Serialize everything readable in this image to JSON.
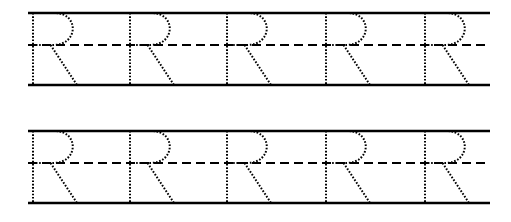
{
  "worksheet": {
    "title": "Letter R Tracing Practice Worksheet",
    "letter": "R",
    "letter_case": "uppercase",
    "background_color": "#ffffff",
    "ink_color": "#000000",
    "guide_line_color": "#000000",
    "trace_dot_color": "#000000",
    "rows": [
      {
        "row_index": 1,
        "name": "practice-row-1",
        "top_rule_y": 13,
        "mid_rule_y": 45,
        "base_rule_y": 85,
        "rule_left_x": 28,
        "rule_right_x": 490,
        "top_rule_style": "solid",
        "mid_rule_style": "dashed",
        "base_rule_style": "solid",
        "letter_count": 5,
        "letter_stem_x": [
          33,
          130,
          227,
          326,
          425
        ],
        "letters": [
          "R",
          "R",
          "R",
          "R",
          "R"
        ]
      },
      {
        "row_index": 2,
        "name": "practice-row-2",
        "top_rule_y": 131,
        "mid_rule_y": 163,
        "base_rule_y": 203,
        "rule_left_x": 28,
        "rule_right_x": 490,
        "top_rule_style": "solid",
        "mid_rule_style": "dashed",
        "base_rule_style": "solid",
        "letter_count": 5,
        "letter_stem_x": [
          33,
          130,
          227,
          326,
          425
        ],
        "letters": [
          "R",
          "R",
          "R",
          "R",
          "R"
        ]
      }
    ],
    "glyph_geometry": {
      "stem_width": 0,
      "letter_width": 46,
      "bowl_right_extent": 40,
      "leg_end_offset_x": 44,
      "dot_size": 1.6,
      "dot_gap": 1.7,
      "rule_thickness": 2.4
    }
  }
}
